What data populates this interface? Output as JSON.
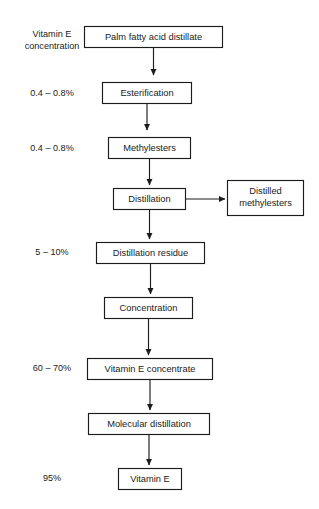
{
  "diagram": {
    "title_fragment": "",
    "side_column_header": {
      "line1": "Vitamin E",
      "line2": "concentration"
    },
    "side_labels": [
      {
        "id": "conc-esterification",
        "text": "0.4 – 0.8%"
      },
      {
        "id": "conc-methylesters",
        "text": "0.4 – 0.8%"
      },
      {
        "id": "conc-distillation-residue",
        "text": "5 – 10%"
      },
      {
        "id": "conc-vitamin-e-concentrate",
        "text": "60 – 70%"
      },
      {
        "id": "conc-vitamin-e",
        "text": "95%"
      }
    ],
    "nodes": [
      {
        "id": "palm-fatty-acid-distillate",
        "label": "Palm fatty acid distillate"
      },
      {
        "id": "esterification",
        "label": "Esterification"
      },
      {
        "id": "methylesters",
        "label": "Methylesters"
      },
      {
        "id": "distillation",
        "label": "Distillation"
      },
      {
        "id": "distilled-methylesters-line1",
        "label": "Distilled"
      },
      {
        "id": "distilled-methylesters-line2",
        "label": "methylesters"
      },
      {
        "id": "distillation-residue",
        "label": "Distillation residue"
      },
      {
        "id": "concentration",
        "label": "Concentration"
      },
      {
        "id": "vitamin-e-concentrate",
        "label": "Vitamin E concentrate"
      },
      {
        "id": "molecular-distillation",
        "label": "Molecular distillation"
      },
      {
        "id": "vitamin-e",
        "label": "Vitamin E"
      }
    ],
    "colors": {
      "stroke": "#1c1c1c",
      "fill": "#ffffff",
      "text": "#1a1a1a",
      "background": "#ffffff"
    }
  }
}
